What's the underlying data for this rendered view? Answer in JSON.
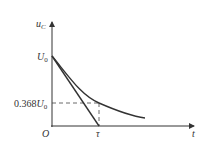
{
  "diagram": {
    "y_axis_label": "u",
    "y_axis_label_sub": "C",
    "x_axis_label": "t",
    "origin_label": "O",
    "u0_label": "U",
    "u0_sub": "0",
    "level_label_num": "0.368",
    "level_label_var": "U",
    "level_label_sub": "0",
    "tau_label": "τ",
    "colors": {
      "line": "#333333",
      "background": "#ffffff"
    }
  }
}
